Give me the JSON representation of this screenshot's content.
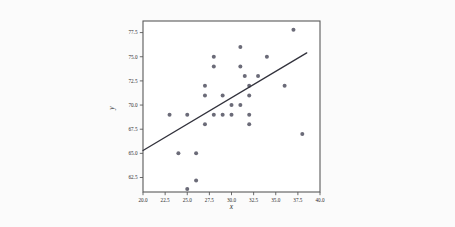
{
  "figure": {
    "background_color": "#fbfbfb",
    "plot_background_color": "#ffffff",
    "frame_color": "#5a5a5a"
  },
  "chart_data": {
    "type": "scatter",
    "title": "",
    "xlabel": "x",
    "ylabel": "y",
    "xlim": [
      20.0,
      40.0
    ],
    "ylim": [
      61.0,
      78.7
    ],
    "grid": false,
    "legend": null,
    "marker_color": "#6b6b78",
    "marker_size": 2.0,
    "xticks": [
      20.0,
      22.5,
      25.0,
      27.5,
      30.0,
      32.5,
      35.0,
      37.5,
      40.0
    ],
    "xticklabels": [
      "20.0",
      "22.5",
      "25.0",
      "27.5",
      "30.0",
      "32.5",
      "35.0",
      "37.5",
      "40.0"
    ],
    "yticks": [
      62.5,
      65.0,
      67.5,
      70.0,
      72.5,
      75.0,
      77.5
    ],
    "yticklabels": [
      "62.5",
      "65.0",
      "67.5",
      "70.0",
      "72.5",
      "75.0",
      "77.5"
    ],
    "points": [
      {
        "x": 23.0,
        "y": 69.0
      },
      {
        "x": 24.0,
        "y": 65.0
      },
      {
        "x": 25.0,
        "y": 69.0
      },
      {
        "x": 25.0,
        "y": 61.3
      },
      {
        "x": 26.0,
        "y": 65.0
      },
      {
        "x": 26.0,
        "y": 62.2
      },
      {
        "x": 27.0,
        "y": 72.0
      },
      {
        "x": 27.0,
        "y": 71.0
      },
      {
        "x": 27.0,
        "y": 68.0
      },
      {
        "x": 28.0,
        "y": 75.0
      },
      {
        "x": 28.0,
        "y": 74.0
      },
      {
        "x": 28.0,
        "y": 69.0
      },
      {
        "x": 29.0,
        "y": 69.0
      },
      {
        "x": 29.0,
        "y": 71.0
      },
      {
        "x": 30.0,
        "y": 70.0
      },
      {
        "x": 30.0,
        "y": 69.0
      },
      {
        "x": 31.0,
        "y": 76.0
      },
      {
        "x": 31.0,
        "y": 74.0
      },
      {
        "x": 31.0,
        "y": 70.0
      },
      {
        "x": 31.5,
        "y": 73.0
      },
      {
        "x": 32.0,
        "y": 72.0
      },
      {
        "x": 32.0,
        "y": 71.0
      },
      {
        "x": 32.0,
        "y": 69.0
      },
      {
        "x": 32.0,
        "y": 68.0
      },
      {
        "x": 33.0,
        "y": 73.0
      },
      {
        "x": 34.0,
        "y": 75.0
      },
      {
        "x": 36.0,
        "y": 72.0
      },
      {
        "x": 37.0,
        "y": 77.8
      },
      {
        "x": 38.0,
        "y": 67.0
      }
    ],
    "fit_line": {
      "type": "linear-regression",
      "color": "#32323c",
      "x_start": 20.0,
      "y_start": 65.3,
      "x_end": 38.5,
      "y_end": 75.4
    }
  }
}
